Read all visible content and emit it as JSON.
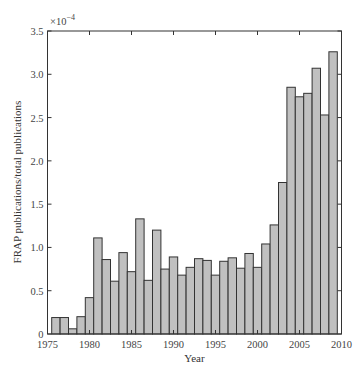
{
  "chart_data": {
    "type": "bar",
    "title": "",
    "xlabel": "Year",
    "ylabel": "FRAP publications/total publications",
    "y_multiplier": "×10",
    "y_multiplier_exp": "−4",
    "xlim": [
      1975,
      2010
    ],
    "ylim": [
      0,
      3.5
    ],
    "x_ticks": [
      1975,
      1980,
      1985,
      1990,
      1995,
      2000,
      2005,
      2010
    ],
    "y_ticks": [
      "0",
      "0.5",
      "1.0",
      "1.5",
      "2.0",
      "2.5",
      "3.0",
      "3.5"
    ],
    "grid": false,
    "legend": null,
    "bar_color": "#c0c0c0",
    "bar_edge_color": "#333333",
    "categories": [
      1976,
      1977,
      1978,
      1979,
      1980,
      1981,
      1982,
      1983,
      1984,
      1985,
      1986,
      1987,
      1988,
      1989,
      1990,
      1991,
      1992,
      1993,
      1994,
      1995,
      1996,
      1997,
      1998,
      1999,
      2000,
      2001,
      2002,
      2003,
      2004,
      2005,
      2006,
      2007,
      2008,
      2009
    ],
    "values": [
      0.19,
      0.19,
      0.06,
      0.2,
      0.42,
      1.11,
      0.86,
      0.61,
      0.94,
      0.72,
      1.33,
      0.62,
      1.2,
      0.75,
      0.89,
      0.68,
      0.77,
      0.87,
      0.85,
      0.68,
      0.84,
      0.88,
      0.76,
      0.93,
      0.77,
      1.04,
      1.26,
      1.75,
      2.85,
      2.74,
      2.78,
      3.07,
      2.53,
      3.26
    ]
  }
}
